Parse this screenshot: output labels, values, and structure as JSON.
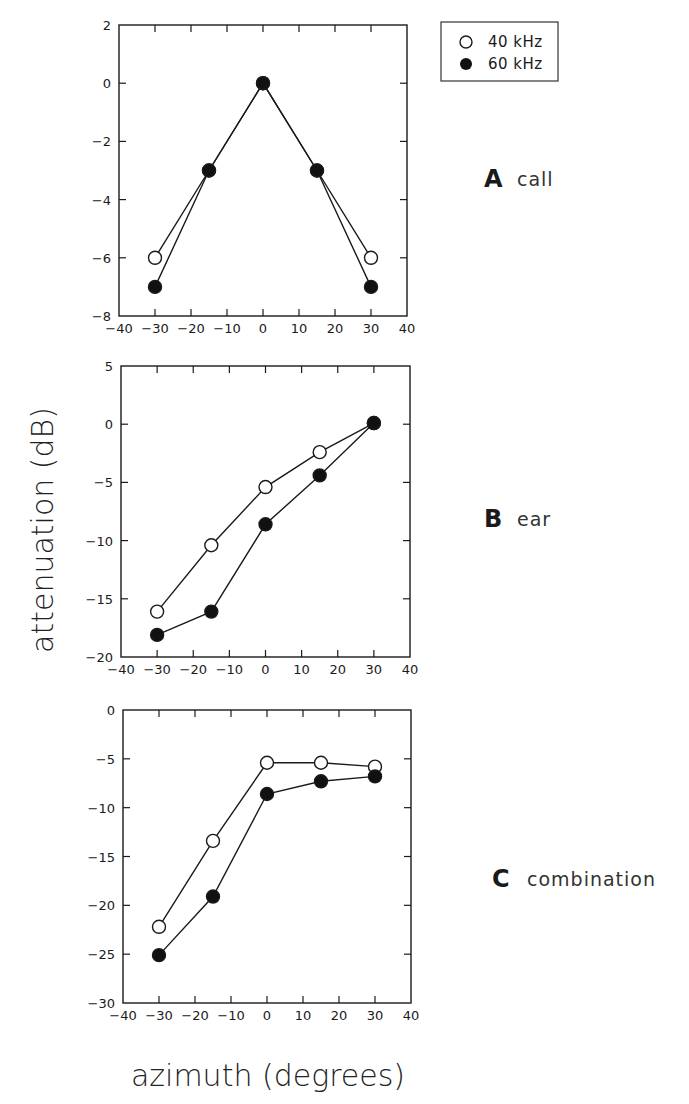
{
  "figure": {
    "ylabel": "attenuation (dB)",
    "xlabel": "azimuth (degrees)",
    "legend": [
      {
        "label": "40 kHz",
        "marker": "open-circle"
      },
      {
        "label": "60 kHz",
        "marker": "filled-circle"
      }
    ]
  },
  "chart_data": [
    {
      "type": "line",
      "panel_letter": "A",
      "title": "call",
      "xlabel": "azimuth (degrees)",
      "ylabel": "attenuation (dB)",
      "x": [
        -30,
        -15,
        0,
        15,
        30
      ],
      "xlim": [
        -40,
        40
      ],
      "xticks": [
        -40,
        -30,
        -20,
        -10,
        0,
        10,
        20,
        30,
        40
      ],
      "ylim": [
        -8,
        2
      ],
      "yticks": [
        2,
        0,
        -2,
        -4,
        -6,
        -8
      ],
      "grid": false,
      "legend_position": "upper right (outside)",
      "series": [
        {
          "name": "40 kHz",
          "marker": "open-circle",
          "values": [
            -6.0,
            -3.0,
            0.0,
            -3.0,
            -6.0
          ]
        },
        {
          "name": "60 kHz",
          "marker": "filled-circle",
          "values": [
            -7.0,
            -3.0,
            0.0,
            -3.0,
            -7.0
          ]
        }
      ]
    },
    {
      "type": "line",
      "panel_letter": "B",
      "title": "ear",
      "xlabel": "azimuth (degrees)",
      "ylabel": "attenuation (dB)",
      "x": [
        -30,
        -15,
        0,
        15,
        30
      ],
      "xlim": [
        -40,
        40
      ],
      "xticks": [
        -40,
        -30,
        -20,
        -10,
        0,
        10,
        20,
        30,
        40
      ],
      "ylim": [
        -20,
        5
      ],
      "yticks": [
        5,
        0,
        -5,
        -10,
        -15,
        -20
      ],
      "grid": false,
      "series": [
        {
          "name": "40 kHz",
          "marker": "open-circle",
          "values": [
            -16.1,
            -10.4,
            -5.4,
            -2.4,
            0.1
          ]
        },
        {
          "name": "60 kHz",
          "marker": "filled-circle",
          "values": [
            -18.1,
            -16.1,
            -8.6,
            -4.4,
            0.1
          ]
        }
      ]
    },
    {
      "type": "line",
      "panel_letter": "C",
      "title": "combination",
      "xlabel": "azimuth (degrees)",
      "ylabel": "attenuation (dB)",
      "x": [
        -30,
        -15,
        0,
        15,
        30
      ],
      "xlim": [
        -40,
        40
      ],
      "xticks": [
        -40,
        -30,
        -20,
        -10,
        0,
        10,
        20,
        30,
        40
      ],
      "ylim": [
        -30,
        0
      ],
      "yticks": [
        0,
        -5,
        -10,
        -15,
        -20,
        -25,
        -30
      ],
      "grid": false,
      "series": [
        {
          "name": "40 kHz",
          "marker": "open-circle",
          "values": [
            -22.2,
            -13.4,
            -5.4,
            -5.4,
            -5.8
          ]
        },
        {
          "name": "60 kHz",
          "marker": "filled-circle",
          "values": [
            -25.1,
            -19.1,
            -8.6,
            -7.3,
            -6.8
          ]
        }
      ]
    }
  ]
}
